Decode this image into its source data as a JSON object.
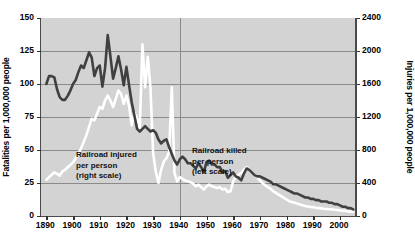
{
  "chart_data": {
    "type": "line",
    "title": "",
    "xlabel": "",
    "background_color": "#d3d3d3",
    "grid": "horizontal and vertical gridlines",
    "legend_position": "inline annotations on plot",
    "xlim": [
      1888,
      2006
    ],
    "x_ticks": [
      "1890",
      "1900",
      "1910",
      "1920",
      "1930",
      "1940",
      "1950",
      "1960",
      "1970",
      "1980",
      "1990",
      "2000"
    ],
    "axes": {
      "left": {
        "label": "Fatalities per 1,000,000 people",
        "ticks": [
          "0",
          "25",
          "50",
          "75",
          "100",
          "125",
          "150"
        ],
        "lim": [
          0,
          150
        ]
      },
      "right": {
        "label": "Injuries per 1,000,000 people",
        "ticks": [
          "0",
          "400",
          "800",
          "1200",
          "1600",
          "2000",
          "2400"
        ],
        "lim": [
          0,
          2400
        ]
      }
    },
    "annotations": [
      {
        "name": "injured-annotation",
        "lines": [
          "Railroad injured",
          "per person",
          "(right scale)"
        ]
      },
      {
        "name": "killed-annotation",
        "lines": [
          "Railroad killed",
          "per person",
          "(left scale)"
        ]
      }
    ],
    "series": [
      {
        "name": "Railroad killed per person (left scale)",
        "color": "#404040",
        "axis": "left",
        "x": [
          1890,
          1891,
          1892,
          1893,
          1894,
          1895,
          1896,
          1897,
          1898,
          1899,
          1900,
          1901,
          1902,
          1903,
          1904,
          1905,
          1906,
          1907,
          1908,
          1909,
          1910,
          1911,
          1912,
          1913,
          1914,
          1915,
          1916,
          1917,
          1918,
          1919,
          1920,
          1921,
          1922,
          1923,
          1924,
          1925,
          1926,
          1927,
          1928,
          1929,
          1930,
          1931,
          1932,
          1933,
          1934,
          1935,
          1936,
          1937,
          1938,
          1939,
          1940,
          1941,
          1942,
          1943,
          1944,
          1945,
          1946,
          1947,
          1948,
          1949,
          1950,
          1951,
          1952,
          1953,
          1954,
          1955,
          1956,
          1957,
          1958,
          1959,
          1960,
          1961,
          1962,
          1963,
          1964,
          1965,
          1966,
          1967,
          1968,
          1969,
          1970,
          1971,
          1972,
          1973,
          1974,
          1975,
          1976,
          1977,
          1978,
          1979,
          1980,
          1981,
          1982,
          1983,
          1984,
          1985,
          1986,
          1987,
          1988,
          1989,
          1990,
          1991,
          1992,
          1993,
          1994,
          1995,
          1996,
          1997,
          1998,
          1999,
          2000,
          2001,
          2002,
          2003,
          2004,
          2005
        ],
        "values": [
          100,
          106,
          106,
          105,
          96,
          90,
          88,
          88,
          91,
          95,
          100,
          103,
          109,
          114,
          112,
          118,
          124,
          120,
          106,
          112,
          114,
          98,
          112,
          137,
          121,
          104,
          112,
          121,
          111,
          99,
          113,
          99,
          86,
          76,
          66,
          64,
          66,
          68,
          66,
          64,
          65,
          63,
          58,
          55,
          57,
          58,
          52,
          47,
          42,
          39,
          43,
          45,
          43,
          40,
          40,
          38,
          36,
          40,
          37,
          33,
          41,
          42,
          39,
          39,
          37,
          37,
          33,
          34,
          29,
          31,
          33,
          30,
          29,
          27,
          32,
          36,
          35,
          33,
          31,
          30,
          30,
          29,
          28,
          27,
          26,
          24,
          24,
          23,
          22,
          21,
          20,
          19,
          18,
          17,
          17,
          16,
          15,
          14,
          14,
          13,
          13,
          12,
          12,
          11,
          11,
          11,
          10,
          10,
          9,
          9,
          8,
          7,
          7,
          6,
          6,
          5
        ]
      },
      {
        "name": "Railroad injured per person (right scale)",
        "color": "#ffffff",
        "axis": "right",
        "x": [
          1890,
          1891,
          1892,
          1893,
          1894,
          1895,
          1896,
          1897,
          1898,
          1899,
          1900,
          1901,
          1902,
          1903,
          1904,
          1905,
          1906,
          1907,
          1908,
          1909,
          1910,
          1911,
          1912,
          1913,
          1914,
          1915,
          1916,
          1917,
          1918,
          1919,
          1920,
          1921,
          1922,
          1923,
          1924,
          1925,
          1926,
          1927,
          1928,
          1929,
          1930,
          1931,
          1932,
          1933,
          1934,
          1935,
          1936,
          1937,
          1938,
          1939,
          1940,
          1941,
          1942,
          1943,
          1944,
          1945,
          1946,
          1947,
          1948,
          1949,
          1950,
          1951,
          1952,
          1953,
          1954,
          1955,
          1956,
          1957,
          1958,
          1959,
          1960,
          1961,
          1962,
          1963,
          1964,
          1965,
          1966,
          1967,
          1968,
          1969,
          1970,
          1971,
          1972,
          1973,
          1974,
          1975,
          1976,
          1977,
          1978,
          1979,
          1980,
          1981,
          1982,
          1983,
          1984,
          1985,
          1986,
          1987,
          1988,
          1989,
          1990,
          1991,
          1992,
          1993,
          1994,
          1995,
          1996,
          1997,
          1998,
          1999,
          2000,
          2001,
          2002,
          2003,
          2004,
          2005
        ],
        "values": [
          440,
          470,
          500,
          530,
          510,
          490,
          540,
          560,
          590,
          620,
          650,
          700,
          760,
          820,
          900,
          980,
          1080,
          1180,
          1160,
          1240,
          1320,
          1300,
          1400,
          1460,
          1400,
          1320,
          1420,
          1520,
          1480,
          1360,
          1460,
          1330,
          1100,
          1250,
          1190,
          1060,
          2080,
          1560,
          1930,
          1560,
          760,
          540,
          400,
          560,
          660,
          700,
          780,
          1560,
          520,
          420,
          470,
          450,
          430,
          420,
          410,
          390,
          360,
          380,
          350,
          320,
          360,
          380,
          360,
          350,
          340,
          350,
          320,
          330,
          290,
          300,
          420,
          480,
          500,
          520,
          560,
          590,
          560,
          530,
          500,
          470,
          430,
          400,
          370,
          350,
          330,
          300,
          280,
          260,
          240,
          220,
          200,
          180,
          170,
          160,
          150,
          140,
          130,
          120,
          115,
          110,
          105,
          100,
          95,
          92,
          88,
          85,
          82,
          80,
          76,
          72,
          68,
          64,
          60,
          56,
          52,
          48
        ]
      }
    ]
  }
}
